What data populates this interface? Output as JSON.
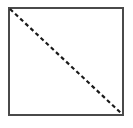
{
  "canvas": {
    "width": 133,
    "height": 128,
    "background_color": "#ffffff",
    "title": "Square with dashed diagonal"
  },
  "figure": {
    "name": "square-with-dashed-diagonal"
  },
  "shapes": {
    "square": {
      "label": "square",
      "x": 9,
      "y": 8,
      "width": 114,
      "height": 107,
      "stroke_color": "#4a4a4a",
      "stroke_width": 2,
      "fill_color": "#ffffff"
    },
    "diagonal": {
      "label": "dashed-diagonal",
      "x1": 10,
      "y1": 9,
      "x2": 122,
      "y2": 114,
      "stroke_color": "#1a1a1a",
      "stroke_width": 2.2,
      "dash_length": 4,
      "gap_length": 3,
      "dash_array": "4 3"
    }
  },
  "chart_data": {
    "type": "diagram",
    "elements": [
      {
        "kind": "rectangle",
        "name": "square",
        "points": [
          [
            9,
            8
          ],
          [
            123,
            8
          ],
          [
            123,
            115
          ],
          [
            9,
            115
          ]
        ],
        "style": "solid",
        "stroke": "#4a4a4a",
        "stroke_width": 2
      },
      {
        "kind": "line",
        "name": "diagonal",
        "points": [
          [
            10,
            9
          ],
          [
            122,
            114
          ]
        ],
        "style": "dashed",
        "stroke": "#1a1a1a",
        "stroke_width": 2.2,
        "dash_pattern": [
          4,
          3
        ]
      }
    ],
    "xlabel": "",
    "ylabel": "",
    "legend": [],
    "grid": false
  }
}
